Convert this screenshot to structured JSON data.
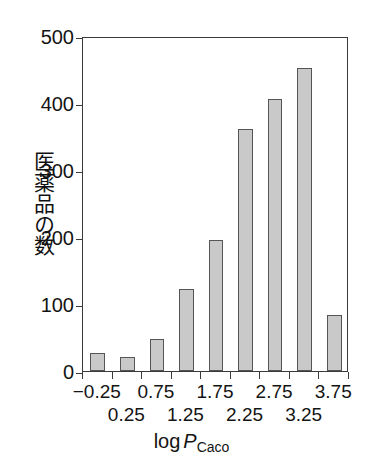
{
  "chart_data": {
    "type": "bar",
    "title": "",
    "xlabel": "log P_Caco",
    "xlabel_parts": {
      "prefix": "log",
      "italic": "P",
      "subscript": "Caco"
    },
    "ylabel": "医薬品の数",
    "categories": [
      "-0.25",
      "0.25",
      "0.75",
      "1.25",
      "1.75",
      "2.25",
      "2.75",
      "3.25",
      "3.75"
    ],
    "values": [
      27,
      21,
      48,
      122,
      196,
      361,
      406,
      452,
      83
    ],
    "xtick_labels_row_top": [
      "−0.25",
      "0.75",
      "1.75",
      "2.75",
      "3.75"
    ],
    "xtick_labels_row_bottom": [
      "0.25",
      "1.25",
      "2.25",
      "3.25"
    ],
    "ytick_labels": [
      "500",
      "400",
      "300",
      "200",
      "100",
      "0"
    ],
    "ytick_values": [
      500,
      400,
      300,
      200,
      100,
      0
    ],
    "ylim": [
      0,
      500
    ],
    "grid": false,
    "legend": false,
    "bar_fill_color": "#c9c9c9",
    "bar_edge_color": "#555555",
    "axis_color": "#3a3a3a"
  },
  "ticks": {
    "y": [
      {
        "label": "500",
        "value": 500
      },
      {
        "label": "400",
        "value": 400
      },
      {
        "label": "300",
        "value": 300
      },
      {
        "label": "200",
        "value": 200
      },
      {
        "label": "100",
        "value": 100
      },
      {
        "label": "0",
        "value": 0
      }
    ],
    "x_top": [
      {
        "label": "−0.25",
        "index": 0
      },
      {
        "label": "0.75",
        "index": 2
      },
      {
        "label": "1.75",
        "index": 4
      },
      {
        "label": "2.75",
        "index": 6
      },
      {
        "label": "3.75",
        "index": 8
      }
    ],
    "x_bottom": [
      {
        "label": "0.25",
        "index": 1
      },
      {
        "label": "1.25",
        "index": 3
      },
      {
        "label": "2.25",
        "index": 5
      },
      {
        "label": "3.25",
        "index": 7
      }
    ]
  }
}
